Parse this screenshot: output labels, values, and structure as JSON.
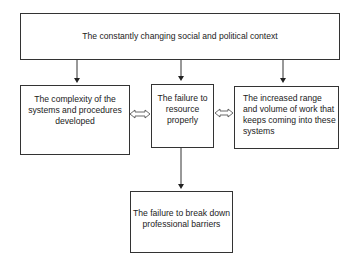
{
  "diagram": {
    "type": "flowchart",
    "nodes": {
      "top": {
        "id": "context",
        "text": "The constantly changing social and political context"
      },
      "left": {
        "id": "complexity",
        "text": "The complexity of the systems and procedures developed"
      },
      "middle": {
        "id": "resource",
        "text": "The failure to resource properly"
      },
      "right": {
        "id": "workload",
        "text": "The increased range and volume of work that keeps coming into these systems"
      },
      "bottom": {
        "id": "barriers",
        "text": "The failure to break down professional barriers"
      }
    },
    "edges": [
      {
        "from": "context",
        "to": "complexity",
        "style": "arrow"
      },
      {
        "from": "context",
        "to": "resource",
        "style": "arrow"
      },
      {
        "from": "context",
        "to": "workload",
        "style": "arrow"
      },
      {
        "from": "complexity",
        "to": "resource",
        "style": "double-hollow-arrow"
      },
      {
        "from": "resource",
        "to": "workload",
        "style": "double-hollow-arrow"
      },
      {
        "from": "resource",
        "to": "barriers",
        "style": "arrow"
      }
    ],
    "colors": {
      "line": "#333333",
      "text": "#222222",
      "background": "#ffffff"
    }
  }
}
